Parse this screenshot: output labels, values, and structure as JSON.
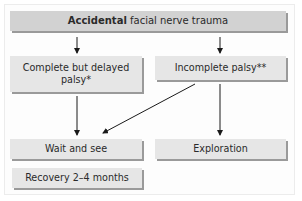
{
  "diagram": {
    "title_bold": "Accidental",
    "title_rest": " facial nerve trauma",
    "nodes": {
      "complete_delayed": "Complete but delayed palsy*",
      "incomplete": "Incomplete palsy**",
      "wait_and_see": "Wait and see",
      "exploration": "Exploration",
      "recovery": "Recovery 2–4 months"
    },
    "edges": [
      {
        "from": "Accidental facial nerve trauma",
        "to": "Complete but delayed palsy*"
      },
      {
        "from": "Accidental facial nerve trauma",
        "to": "Incomplete palsy**"
      },
      {
        "from": "Complete but delayed palsy*",
        "to": "Wait and see"
      },
      {
        "from": "Incomplete palsy**",
        "to": "Wait and see"
      },
      {
        "from": "Incomplete palsy**",
        "to": "Exploration"
      }
    ],
    "colors": {
      "top_box": "#d2d2d2",
      "box": "#e6e6e6",
      "shadow": "#9a9a9a",
      "arrow": "#1a1a1a"
    }
  }
}
